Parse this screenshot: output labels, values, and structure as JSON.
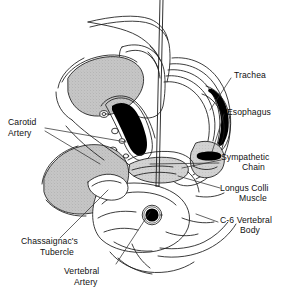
{
  "figure": {
    "width": 284,
    "height": 290,
    "background_color": "#ffffff",
    "line_color": "#1a1a1a",
    "muscle_fill_color": "#c4c4c4",
    "vessel_fill_color": "#000000",
    "tissue_fill_color": "#ffffff"
  },
  "labels": {
    "trachea": "Trachea",
    "esophagus": "Esophagus",
    "sympathetic_chain_line1": "Sympathetic",
    "sympathetic_chain_line2": "Chain",
    "longus_colli_line1": "Longus Colli",
    "longus_colli_line2": "Muscle",
    "c6_vertebral_body_line1": "C-6 Vertebral",
    "c6_vertebral_body_line2": "Body",
    "carotid_artery_line1": "Carotid",
    "carotid_artery_line2": "Artery",
    "chassaignacs_tubercle_line1": "Chassaignac's",
    "chassaignacs_tubercle_line2": "Tubercle",
    "vertebral_artery_line1": "Vertebral",
    "vertebral_artery_line2": "Artery"
  }
}
